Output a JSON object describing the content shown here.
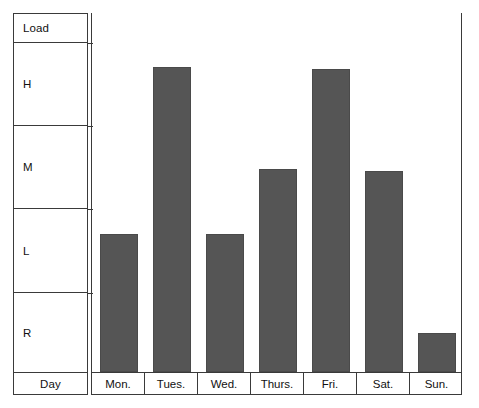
{
  "chart_data": {
    "type": "bar",
    "title": "",
    "xlabel": "Day",
    "ylabel": "Load",
    "categories": [
      "Mon.",
      "Tues.",
      "Wed.",
      "Thurs.",
      "Fri.",
      "Sat.",
      "Sun."
    ],
    "values": [
      "L",
      "H",
      "L",
      "M",
      "H",
      "M",
      "R"
    ],
    "value_levels": [
      "R",
      "L",
      "M",
      "H"
    ],
    "y_tick_labels": [
      "H",
      "M",
      "L",
      "R"
    ],
    "ylim": [
      "R",
      "H"
    ],
    "grid": false,
    "legend": null,
    "bar_color": "#555555",
    "axis_color": "#3a3a3a",
    "bar_heights_pct": [
      38.5,
      85.0,
      38.5,
      56.5,
      84.5,
      56.0,
      11.0
    ],
    "series": [
      {
        "name": "Load",
        "points": [
          {
            "day": "Mon.",
            "level": "L",
            "height_pct": 38.5
          },
          {
            "day": "Tues.",
            "level": "H",
            "height_pct": 85.0
          },
          {
            "day": "Wed.",
            "level": "L",
            "height_pct": 38.5
          },
          {
            "day": "Thurs.",
            "level": "M",
            "height_pct": 56.5
          },
          {
            "day": "Fri.",
            "level": "H",
            "height_pct": 84.5
          },
          {
            "day": "Sat.",
            "level": "M",
            "height_pct": 56.0
          },
          {
            "day": "Sun.",
            "level": "R",
            "height_pct": 11.0
          }
        ]
      }
    ]
  },
  "axis": {
    "header_label": "Load",
    "footer_label": "Day",
    "bands": [
      {
        "label": "H",
        "top_pct": 7.85,
        "height_pct": 21.7
      },
      {
        "label": "M",
        "top_pct": 29.6,
        "height_pct": 21.7
      },
      {
        "label": "L",
        "top_pct": 51.3,
        "height_pct": 22.0
      },
      {
        "label": "R",
        "top_pct": 73.3,
        "height_pct": 20.9
      }
    ]
  },
  "days": [
    {
      "label": "Mon."
    },
    {
      "label": "Tues."
    },
    {
      "label": "Wed."
    },
    {
      "label": "Thurs."
    },
    {
      "label": "Fri."
    },
    {
      "label": "Sat."
    },
    {
      "label": "Sun."
    }
  ]
}
